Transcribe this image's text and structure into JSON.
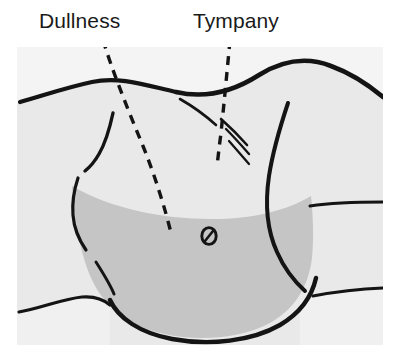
{
  "figure": {
    "kind": "medical-illustration",
    "labels": {
      "dullness": "Dullness",
      "tympany": "Tympany"
    },
    "colors": {
      "page_background": "#ffffff",
      "panel_background": "#f2f2f2",
      "body_fill": "#e8e8e8",
      "dullness_fill": "#c4c4c4",
      "outline": "#111111",
      "label_text": "#1a1a1a",
      "leader_line": "#111111"
    },
    "regions": [
      {
        "name": "tympany-region",
        "label": "Tympany",
        "description": "upper non-shaded abdominal area, gas-filled",
        "fill": "#e8e8e8"
      },
      {
        "name": "dullness-region",
        "label": "Dullness",
        "description": "lower shaded abdominal area, fluid-filled, upper border concave arc",
        "fill": "#c4c4c4"
      }
    ],
    "markers": [
      {
        "name": "umbilicus",
        "description": "navel marked as small oval with diagonal line",
        "x": 209,
        "y": 236
      }
    ],
    "leader_lines": [
      {
        "name": "dullness-leader",
        "from_label": "Dullness",
        "style": "dashed",
        "points": "103,40 110,58 124,95 140,136 152,172 163,205 170,232"
      },
      {
        "name": "tympany-leader",
        "from_label": "Tympany",
        "style": "dashed",
        "points": "229,40 226,72 222,108 219,140 217,163"
      }
    ],
    "panel": {
      "x": 17,
      "y": 47,
      "width": 366,
      "height": 298
    }
  }
}
